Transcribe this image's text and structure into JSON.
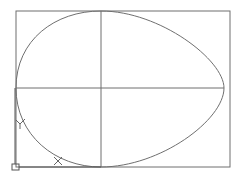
{
  "drawing": {
    "background": "#ffffff",
    "stroke_color": "#6f6f6f",
    "rectangle": {
      "x": 16,
      "y": 11,
      "width": 214,
      "height": 156
    },
    "axes": {
      "vertical_x": 101,
      "horizontal_y": 88
    },
    "egg_curve": {
      "left_point": [
        16,
        88
      ],
      "top_point": [
        101,
        11
      ],
      "right_point": [
        224,
        88
      ],
      "bottom_point": [
        101,
        167
      ]
    }
  },
  "ucs_icon": {
    "x_label": "X",
    "y_label": "Y",
    "origin": [
      15,
      167
    ]
  }
}
